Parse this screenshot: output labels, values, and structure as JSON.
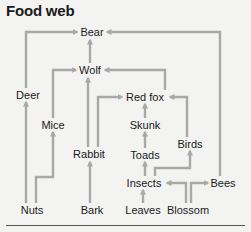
{
  "title": "Food web",
  "colors": {
    "background": "#f3f3f1",
    "text": "#1a1a1a",
    "arrow": "#a8a8a8",
    "rule": "#555555"
  },
  "nodes": {
    "bear": {
      "label": "Bear",
      "x": 92,
      "y": 32
    },
    "wolf": {
      "label": "Wolf",
      "x": 90,
      "y": 70
    },
    "deer": {
      "label": "Deer",
      "x": 28,
      "y": 95
    },
    "redfox": {
      "label": "Red fox",
      "x": 145,
      "y": 97
    },
    "mice": {
      "label": "Mice",
      "x": 53,
      "y": 125
    },
    "skunk": {
      "label": "Skunk",
      "x": 145,
      "y": 125
    },
    "birds": {
      "label": "Birds",
      "x": 190,
      "y": 144
    },
    "rabbit": {
      "label": "Rabbit",
      "x": 89,
      "y": 154
    },
    "toads": {
      "label": "Toads",
      "x": 145,
      "y": 155
    },
    "insects": {
      "label": "Insects",
      "x": 144,
      "y": 183
    },
    "bees": {
      "label": "Bees",
      "x": 223,
      "y": 183
    },
    "nuts": {
      "label": "Nuts",
      "x": 32,
      "y": 210
    },
    "bark": {
      "label": "Bark",
      "x": 92,
      "y": 210
    },
    "leaves": {
      "label": "Leaves",
      "x": 143,
      "y": 210
    },
    "blossom": {
      "label": "Blossom",
      "x": 188,
      "y": 210
    }
  },
  "edges": [
    {
      "from": "Deer",
      "to": "Bear"
    },
    {
      "from": "Wolf",
      "to": "Bear"
    },
    {
      "from": "Bees",
      "to": "Bear"
    },
    {
      "from": "Mice",
      "to": "Wolf"
    },
    {
      "from": "Rabbit",
      "to": "Wolf"
    },
    {
      "from": "Red fox",
      "to": "Wolf"
    },
    {
      "from": "Rabbit",
      "to": "Red fox"
    },
    {
      "from": "Skunk",
      "to": "Red fox"
    },
    {
      "from": "Birds",
      "to": "Red fox"
    },
    {
      "from": "Toads",
      "to": "Skunk"
    },
    {
      "from": "Insects",
      "to": "Toads"
    },
    {
      "from": "Insects",
      "to": "Birds"
    },
    {
      "from": "Leaves",
      "to": "Insects"
    },
    {
      "from": "Blossom",
      "to": "Insects"
    },
    {
      "from": "Blossom",
      "to": "Bees"
    },
    {
      "from": "Nuts",
      "to": "Deer"
    },
    {
      "from": "Nuts",
      "to": "Mice"
    },
    {
      "from": "Bark",
      "to": "Rabbit"
    }
  ]
}
